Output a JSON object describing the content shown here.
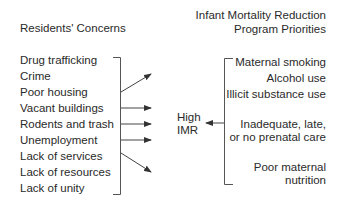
{
  "left": {
    "title": "Residents' Concerns",
    "items": [
      "Drug trafficking",
      "Crime",
      "Poor housing",
      "Vacant buildings",
      "Rodents and trash",
      "Unemployment",
      "Lack of services",
      "Lack of resources",
      "Lack of unity"
    ]
  },
  "right": {
    "title_line1": "Infant Mortality Reduction",
    "title_line2": "Program Priorities",
    "items": [
      "Maternal smoking",
      "Alcohol use",
      "Illicit substance use",
      "Inadequate, late,",
      "or no prenatal care",
      "Poor maternal",
      "nutrition"
    ]
  },
  "center": {
    "line1": "High",
    "line2": "IMR"
  },
  "colors": {
    "text": "#2a2a2a",
    "lines": "#444444"
  }
}
